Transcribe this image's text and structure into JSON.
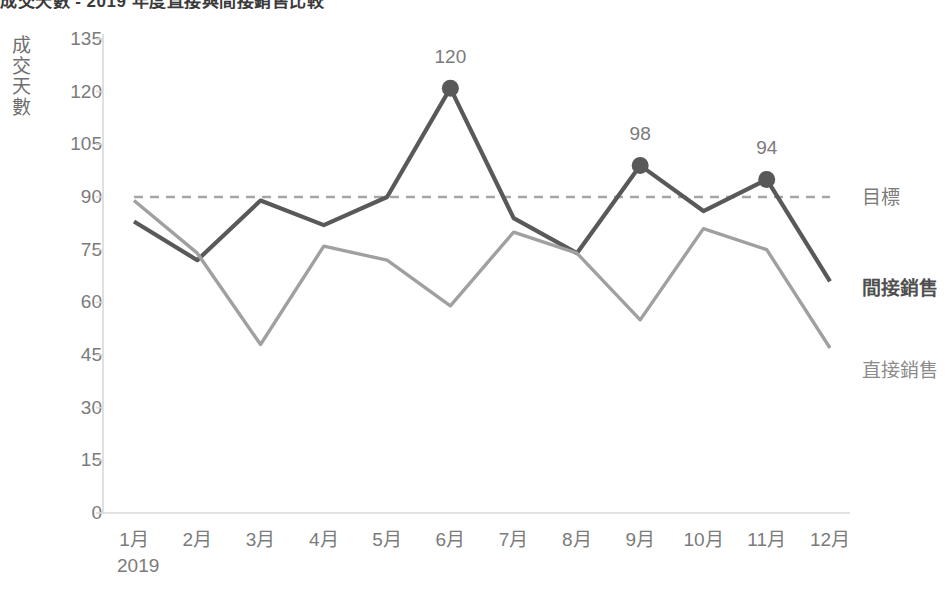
{
  "title": "成交天數 - 2019 年度直接與間接銷售比較",
  "axis": {
    "y_title": "成交天數",
    "y_ticks": [
      135,
      120,
      105,
      90,
      75,
      60,
      45,
      30,
      15,
      0
    ],
    "x_year": "2019",
    "x_ticks": [
      "1月",
      "2月",
      "3月",
      "4月",
      "5月",
      "6月",
      "7月",
      "8月",
      "9月",
      "10月",
      "11月",
      "12月"
    ]
  },
  "series_labels": {
    "target": "目標",
    "indirect": "間接銷售",
    "direct": "直接銷售"
  },
  "colors": {
    "target": "#a6a6a6",
    "indirect": "#595959",
    "direct": "#a0a0a0",
    "axis": "#d9d9d9",
    "text": "#7b7b7b"
  },
  "data_labels": [
    {
      "month": "6月",
      "value": "120"
    },
    {
      "month": "9月",
      "value": "98"
    },
    {
      "month": "11月",
      "value": "94"
    }
  ],
  "chart_data": {
    "type": "line",
    "title": "成交天數 - 2019 年度直接與間接銷售比較",
    "xlabel": "2019",
    "ylabel": "成交天數",
    "ylim": [
      0,
      135
    ],
    "ytick_step": 15,
    "grid": false,
    "legend": "right-inline-labels",
    "categories": [
      "1月",
      "2月",
      "3月",
      "4月",
      "5月",
      "6月",
      "7月",
      "8月",
      "9月",
      "10月",
      "11月",
      "12月"
    ],
    "series": [
      {
        "name": "目標",
        "style": "dashed",
        "color": "#a6a6a6",
        "values": [
          90,
          90,
          90,
          90,
          90,
          90,
          90,
          90,
          90,
          90,
          90,
          90
        ]
      },
      {
        "name": "間接銷售",
        "style": "solid",
        "color": "#595959",
        "emphasis": true,
        "values": [
          83,
          72,
          89,
          82,
          90,
          121,
          84,
          74,
          99,
          86,
          95,
          66
        ],
        "markers": [
          {
            "category": "6月",
            "value": 121,
            "label": "120"
          },
          {
            "category": "9月",
            "value": 99,
            "label": "98"
          },
          {
            "category": "11月",
            "value": 95,
            "label": "94"
          }
        ]
      },
      {
        "name": "直接銷售",
        "style": "solid",
        "color": "#a0a0a0",
        "values": [
          89,
          74,
          48,
          76,
          72,
          59,
          80,
          74,
          55,
          81,
          75,
          47
        ]
      }
    ]
  }
}
